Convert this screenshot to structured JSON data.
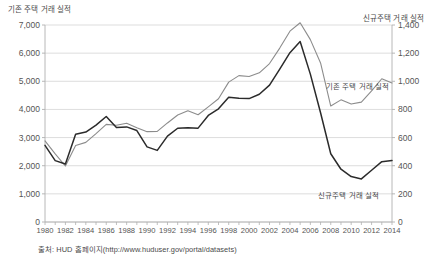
{
  "chart_data": {
    "type": "line",
    "title": "",
    "xlabel": "",
    "ylabel": "기존 주택 거래 실적",
    "y2label": "신규주택 거래 실적",
    "grid": true,
    "legend_position": "inline-annotation",
    "x": [
      1980,
      1981,
      1982,
      1983,
      1984,
      1985,
      1986,
      1987,
      1988,
      1989,
      1990,
      1991,
      1992,
      1993,
      1994,
      1995,
      1996,
      1997,
      1998,
      1999,
      2000,
      2001,
      2002,
      2003,
      2004,
      2005,
      2006,
      2007,
      2008,
      2009,
      2010,
      2011,
      2012,
      2013,
      2014
    ],
    "xlim": [
      1980,
      2014
    ],
    "xticks": [
      "1980",
      "1982",
      "1984",
      "1986",
      "1988",
      "1990",
      "1992",
      "1994",
      "1996",
      "1998",
      "2000",
      "2002",
      "2004",
      "2006",
      "2008",
      "2010",
      "2012",
      "2014"
    ],
    "yticks_left": [
      "0",
      "1,000",
      "2,000",
      "3,000",
      "4,000",
      "5,000",
      "6,000",
      "7,000"
    ],
    "yticks_right": [
      "0",
      "200",
      "400",
      "600",
      "800",
      "1,000",
      "1,200",
      "1,400"
    ],
    "ylim_left": [
      0,
      7000
    ],
    "ylim_right": [
      0,
      1400
    ],
    "series": [
      {
        "name": "기존 주택 거래 실적",
        "axis": "left",
        "color": "#8c8c8c",
        "values": [
          2880,
          2420,
          1990,
          2720,
          2830,
          3140,
          3470,
          3440,
          3510,
          3350,
          3210,
          3220,
          3520,
          3800,
          3950,
          3810,
          4090,
          4380,
          4970,
          5200,
          5170,
          5300,
          5630,
          6180,
          6780,
          7080,
          6480,
          5650,
          4120,
          4340,
          4190,
          4260,
          4660,
          5090,
          4940
        ]
      },
      {
        "name": "신규주택 거래 실적",
        "axis": "right",
        "color": "#2b2b2b",
        "values": [
          545,
          436,
          412,
          623,
          639,
          688,
          750,
          671,
          676,
          650,
          534,
          509,
          610,
          666,
          670,
          667,
          757,
          804,
          886,
          880,
          877,
          908,
          973,
          1086,
          1203,
          1283,
          1051,
          776,
          485,
          375,
          323,
          306,
          368,
          429,
          437
        ]
      }
    ]
  },
  "annotations": {
    "existing_label": "기존 주택 거래 실적",
    "new_label": "신규주택 거래 실적"
  },
  "source": {
    "text": "출처: HUD 홈페이지(http://www.huduser.gov/portal/datasets)"
  },
  "colors": {
    "existing_line": "#8c8c8c",
    "new_line": "#2b2b2b",
    "grid": "#d4d4d4",
    "axis": "#b0b0b0",
    "text": "#4a4a4a",
    "background": "#ffffff"
  }
}
